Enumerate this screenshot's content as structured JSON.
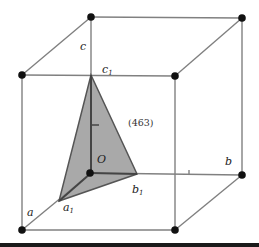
{
  "figure": {
    "type": "unit cell with crystal plane",
    "plane_label": "(463)",
    "axis_labels": {
      "a": "a",
      "b": "b",
      "c": "c"
    },
    "intercept_labels": {
      "a1": "a",
      "a1_sub": "1",
      "b1": "b",
      "b1_sub": "1",
      "c1": "c",
      "c1_sub": "1"
    },
    "origin_label": "O",
    "colors": {
      "edge": "#777777",
      "vertex": "#111111",
      "plane_fill": "#9a9a9a",
      "plane_edge": "#555555",
      "bottom_bar": "#1a1a1a"
    }
  }
}
